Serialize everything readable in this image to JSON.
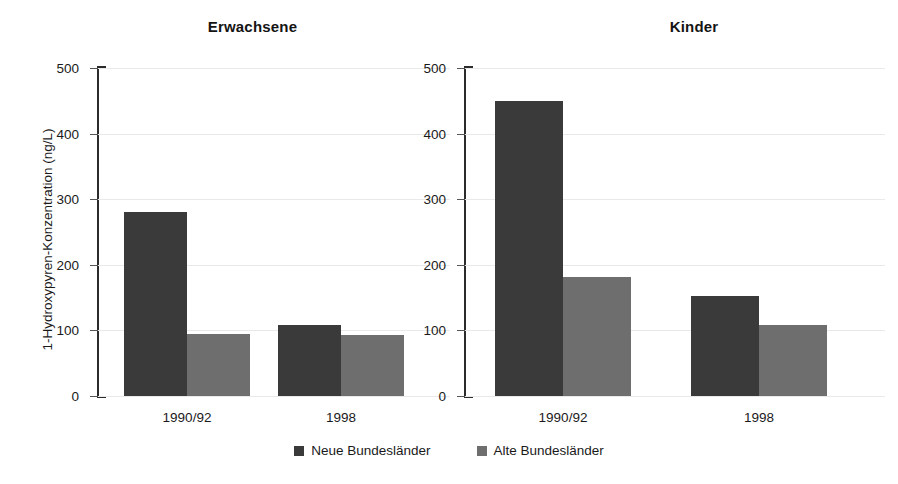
{
  "chart_data": {
    "type": "bar",
    "panels": [
      {
        "title": "Erwachsene",
        "categories": [
          "1990/92",
          "1998"
        ],
        "series": [
          {
            "name": "Neue Bundesländer",
            "values": [
              280,
              108
            ]
          },
          {
            "name": "Alte Bundesländer",
            "values": [
              95,
              93
            ]
          }
        ]
      },
      {
        "title": "Kinder",
        "categories": [
          "1990/92",
          "1998"
        ],
        "series": [
          {
            "name": "Neue Bundesländer",
            "values": [
              450,
              152
            ]
          },
          {
            "name": "Alte Bundesländer",
            "values": [
              181,
              108
            ]
          }
        ]
      }
    ],
    "ylabel": "1-Hydroxypyren-Konzentration (ng/L)",
    "xlabel": "",
    "ylim": [
      0,
      500
    ],
    "yticks": [
      0,
      100,
      200,
      300,
      400,
      500
    ],
    "ytick_labels": [
      "0",
      "100",
      "200",
      "300",
      "400",
      "500"
    ],
    "grid": true,
    "legend": {
      "position": "bottom-center",
      "entries": [
        {
          "label": "Neue Bundesländer",
          "color": "#3a3a3a"
        },
        {
          "label": "Alte Bundesländer",
          "color": "#6e6e6e"
        }
      ]
    },
    "colors": {
      "series_dark": "#3a3a3a",
      "series_light": "#6e6e6e",
      "axis": "#2b2b2b",
      "gridline": "#e9e9e9",
      "text": "#1a1a1a",
      "background": "#ffffff"
    }
  },
  "axis": {
    "ylabel": "1-Hydroxypyren-Konzentration (ng/L)",
    "ticks": [
      "500",
      "400",
      "300",
      "200",
      "100",
      "0"
    ]
  },
  "panels": {
    "adults": {
      "title": "Erwachsene",
      "x_labels": [
        "1990/92",
        "1998"
      ]
    },
    "kids": {
      "title": "Kinder",
      "x_labels": [
        "1990/92",
        "1998"
      ]
    }
  },
  "legend": {
    "neue": "Neue Bundesländer",
    "alte": "Alte Bundesländer"
  }
}
